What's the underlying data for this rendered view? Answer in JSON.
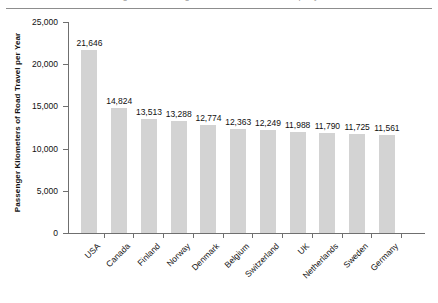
{
  "page": {
    "header_cut_text": "Figure — Passenger kilometers of road travel per year",
    "rule_color": "#8d8d8d"
  },
  "chart_data": {
    "type": "bar",
    "title": "",
    "xlabel": "",
    "ylabel": "Passenger Kilometers of Road Travel per Year",
    "ylim": [
      0,
      25000
    ],
    "grid": false,
    "legend": "none",
    "bar_color": "#d3d3d3",
    "axis_color": "#6f6f6f",
    "ytick_labels": [
      "25,000",
      "20,000",
      "15,000",
      "10,000",
      "5,000",
      "0"
    ],
    "ytick_values": [
      25000,
      20000,
      15000,
      10000,
      5000,
      0
    ],
    "categories": [
      "USA",
      "Canada",
      "Finland",
      "Norway",
      "Denmark",
      "Belgium",
      "Switzerland",
      "UK",
      "Netherlands",
      "Sweden",
      "Germany"
    ],
    "values": [
      21646,
      14824,
      13513,
      13288,
      12774,
      12363,
      12249,
      11988,
      11790,
      11725,
      11561
    ],
    "value_labels": [
      "21,646",
      "14,824",
      "13,513",
      "13,288",
      "12,774",
      "12,363",
      "12,249",
      "11,988",
      "11,790",
      "11,725",
      "11,561"
    ]
  }
}
